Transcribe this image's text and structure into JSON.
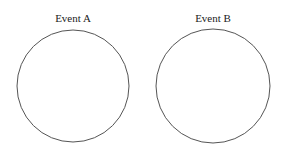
{
  "diagram": {
    "type": "two-event-circles",
    "stroke_color": "#555555",
    "background": "#ffffff",
    "events": [
      {
        "label": "Event A",
        "cx": 73,
        "cy": 86,
        "r": 56
      },
      {
        "label": "Event B",
        "cx": 213,
        "cy": 86,
        "r": 57
      }
    ]
  }
}
